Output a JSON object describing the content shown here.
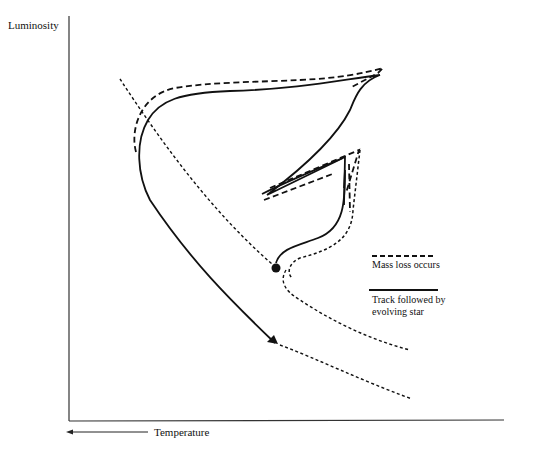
{
  "diagram": {
    "y_axis_label": "Luminosity",
    "x_axis_label": "Temperature",
    "x_axis_direction": "decreasing-to-right (arrow points left)",
    "legend": {
      "dashed": "Mass loss occurs",
      "solid_line1": "Track followed by",
      "solid_line2": "evolving star"
    }
  },
  "colors": {
    "ink": "#111111",
    "background": "#ffffff"
  }
}
